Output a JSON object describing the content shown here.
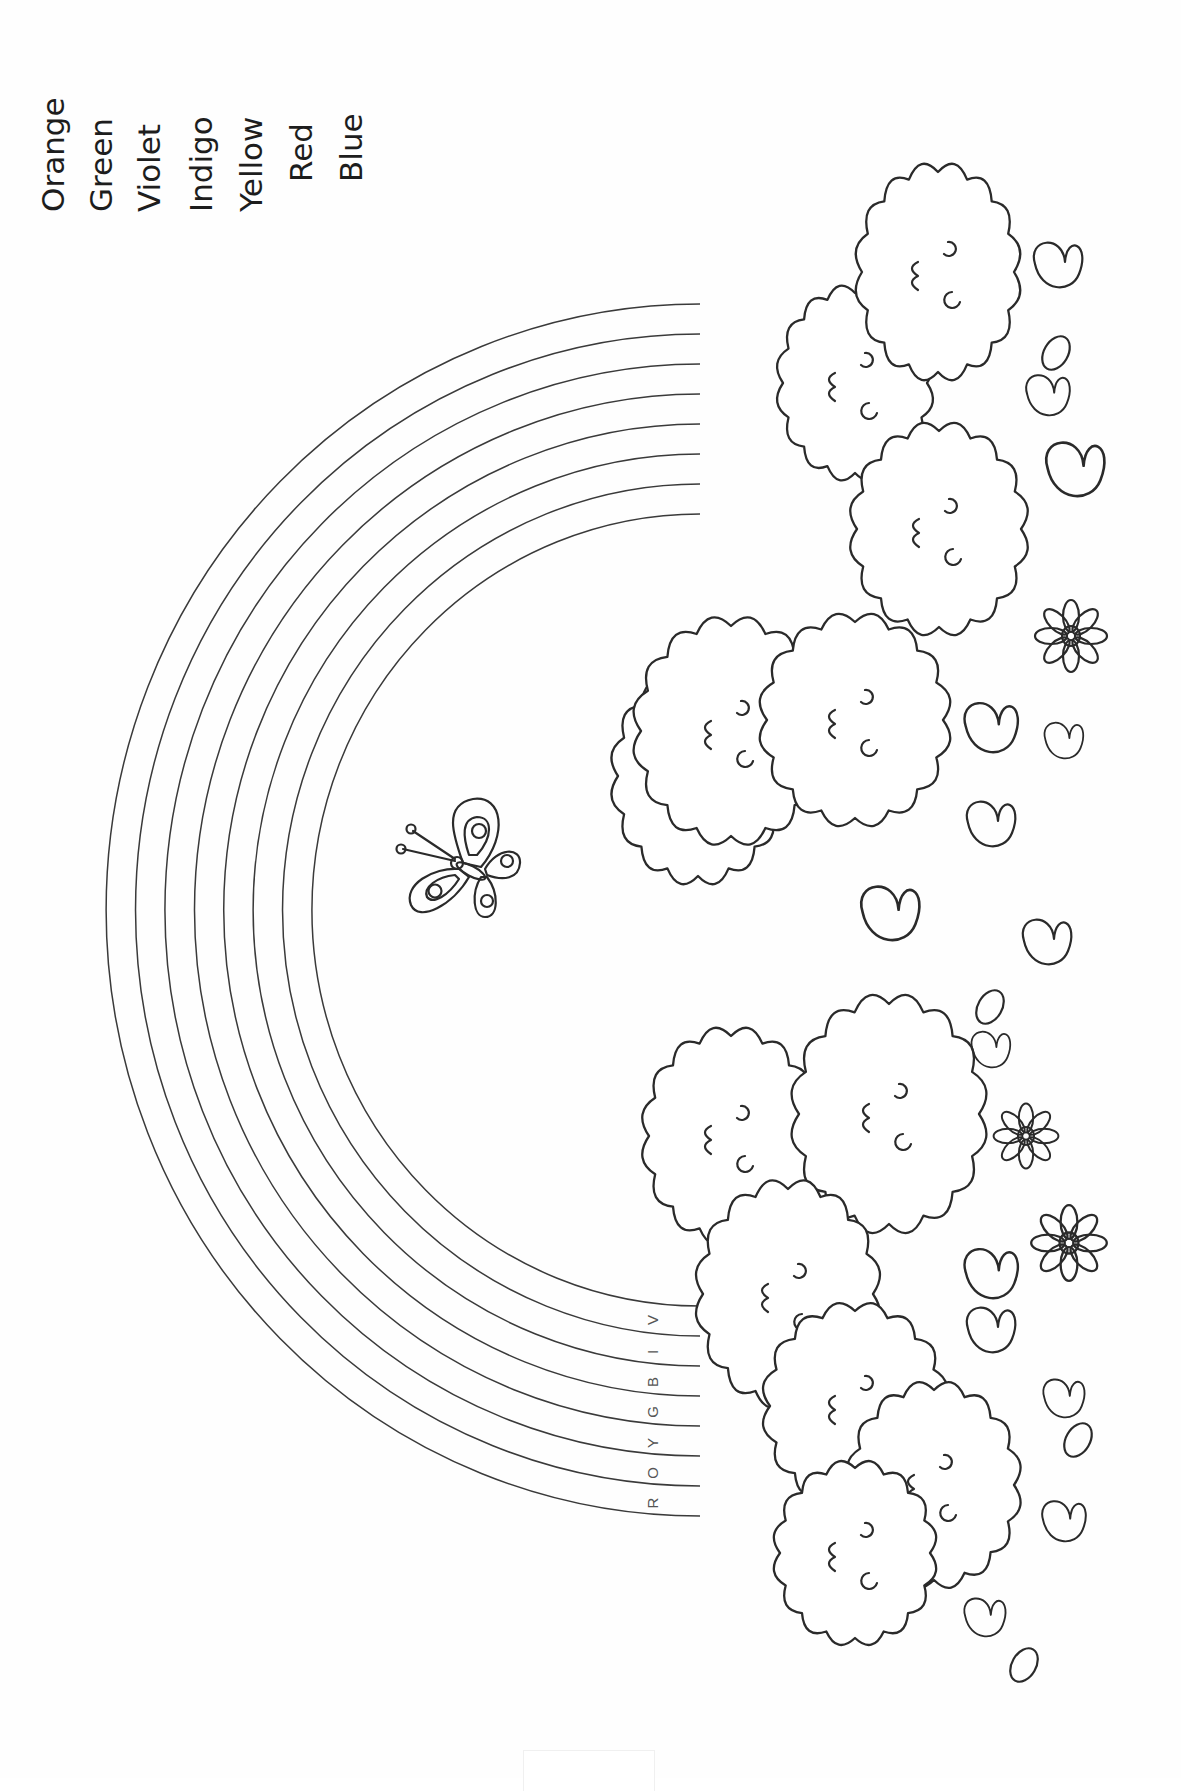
{
  "page": {
    "type": "coloring-sheet",
    "orientation": "rotated-90-ccw",
    "background": "#ffffff",
    "line_color": "#2a2a2a"
  },
  "legend": {
    "words": [
      "Orange",
      "Green",
      "Violet",
      "Indigo",
      "Yellow",
      "Red",
      "Blue"
    ]
  },
  "rainbow": {
    "band_count": 7,
    "arc_line_count": 8,
    "band_letters": [
      "R",
      "O",
      "Y",
      "G",
      "B",
      "I",
      "V"
    ]
  },
  "decorations": {
    "butterfly_count": 1,
    "bush_count": 12,
    "flower_count": 3,
    "leaf_count": 14
  }
}
